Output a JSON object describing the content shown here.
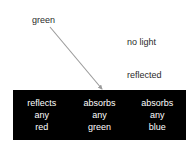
{
  "diagram": {
    "background_color": "#ffffff",
    "band_color": "#000000",
    "band_text_color": "#ffffff",
    "label_text_color": "#2b2b2b",
    "arrow_color": "#9a9a9a"
  },
  "labels": {
    "incoming": "green",
    "outgoing_line1": "no light",
    "outgoing_line2": "reflected"
  },
  "band": {
    "columns": [
      {
        "action": "reflects",
        "qualifier": "any",
        "color": "red"
      },
      {
        "action": "absorbs",
        "qualifier": "any",
        "color": "green"
      },
      {
        "action": "absorbs",
        "qualifier": "any",
        "color": "blue"
      }
    ]
  },
  "arrow": {
    "name": "incoming-light-arrow",
    "from_x": 50,
    "from_y": 27,
    "to_x": 104,
    "to_y": 92
  }
}
